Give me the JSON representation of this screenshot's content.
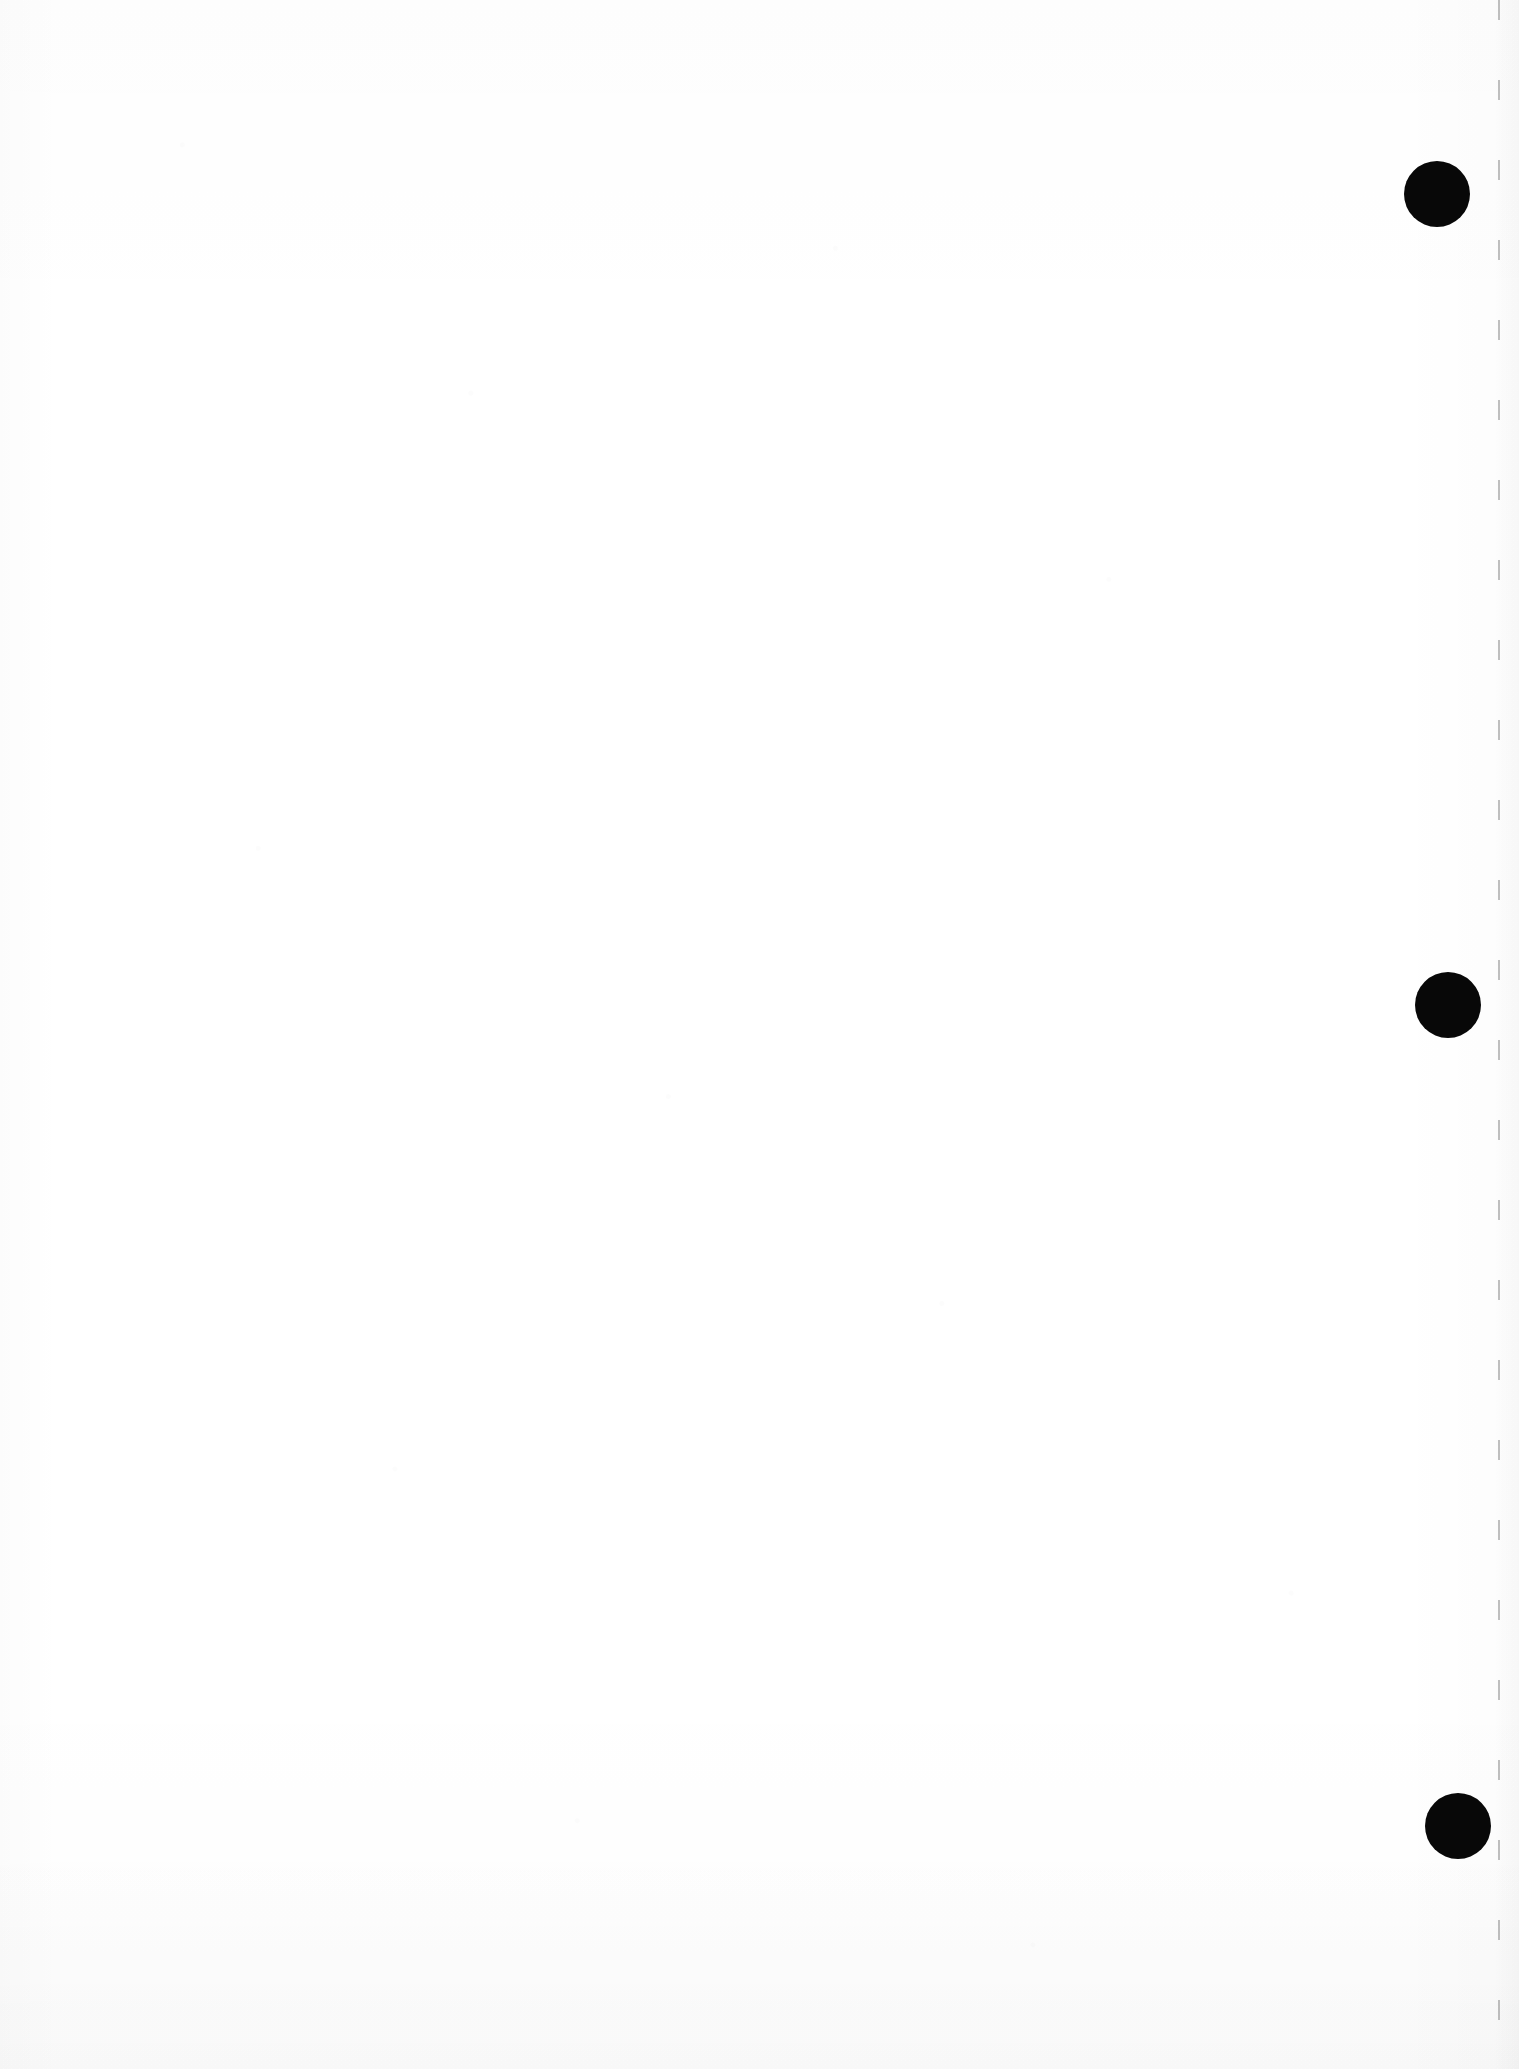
{
  "page": {
    "kind": "scanned-blank-page",
    "width": 1519,
    "height": 2069,
    "background_color": "#ffffff",
    "paper_tone": "#fdfdfd",
    "has_visible_text": false,
    "text_content": "",
    "description_label": ""
  },
  "marks": {
    "ink_color": "#080808",
    "register_dots": [
      {
        "label": "register-dot-top",
        "cx": 1437,
        "cy": 194,
        "diameter": 66
      },
      {
        "label": "register-dot-middle",
        "cx": 1448,
        "cy": 1005,
        "diameter": 66
      },
      {
        "label": "register-dot-bottom",
        "cx": 1458,
        "cy": 1826,
        "diameter": 66
      }
    ]
  },
  "guides": {
    "margin_line": {
      "label": "right-margin-dashed-line",
      "x": 1498,
      "top": 0,
      "height": 2069,
      "color": "#8c8c8c",
      "style": "dashed",
      "dash_length": 20,
      "dash_gap": 60
    }
  }
}
